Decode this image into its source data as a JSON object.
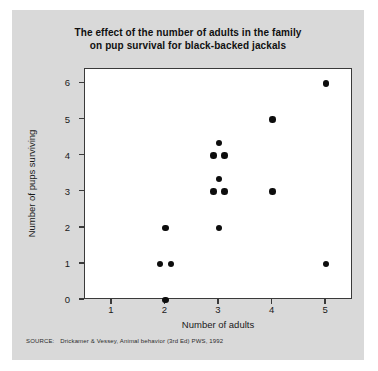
{
  "figure": {
    "background_color": "#d9d9d9",
    "plot_background_color": "#ffffff",
    "frame_color": "#3a3a3a",
    "point_color": "#0d0d0d"
  },
  "title": {
    "line1": "The effect of the number of adults in the family",
    "line2": "on pup survival for black-backed jackals"
  },
  "source": {
    "label": "SOURCE:",
    "text": "Drickamer & Vessey, Animal behavior (3rd Ed) PWS, 1992"
  },
  "chart_data": {
    "type": "scatter",
    "title": "The effect of the number of adults in the family on pup survival for black-backed jackals",
    "xlabel": "Number of adults",
    "ylabel": "Number of pups surviving",
    "xlim": [
      0.5,
      5.5
    ],
    "ylim": [
      0,
      6.4
    ],
    "grid": false,
    "legend": null,
    "x_ticks": [
      1,
      2,
      3,
      4,
      5
    ],
    "x_tick_labels": [
      "1",
      "2",
      "3",
      "4",
      "5"
    ],
    "y_ticks": [
      0,
      1,
      2,
      3,
      4,
      5,
      6
    ],
    "y_tick_labels": [
      "0",
      "1",
      "2",
      "3",
      "4",
      "5",
      "6"
    ],
    "points": [
      {
        "x": 2,
        "y": 0
      },
      {
        "x": 1.9,
        "y": 1
      },
      {
        "x": 2.1,
        "y": 1
      },
      {
        "x": 2,
        "y": 2
      },
      {
        "x": 3,
        "y": 2
      },
      {
        "x": 2.9,
        "y": 3
      },
      {
        "x": 3.1,
        "y": 3
      },
      {
        "x": 3,
        "y": 3.35
      },
      {
        "x": 2.9,
        "y": 4
      },
      {
        "x": 3.1,
        "y": 4
      },
      {
        "x": 3,
        "y": 4.35
      },
      {
        "x": 4,
        "y": 3
      },
      {
        "x": 4,
        "y": 5
      },
      {
        "x": 5,
        "y": 1
      },
      {
        "x": 5,
        "y": 6
      }
    ],
    "point_count": 15
  }
}
